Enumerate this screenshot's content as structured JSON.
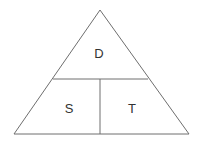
{
  "diagram": {
    "type": "formula-triangle",
    "colors": {
      "line": "#6e6e6e",
      "text": "#333333",
      "background": "#ffffff"
    },
    "sections": {
      "top": {
        "label": "D"
      },
      "bottom_left": {
        "label": "S"
      },
      "bottom_right": {
        "label": "T"
      }
    }
  }
}
